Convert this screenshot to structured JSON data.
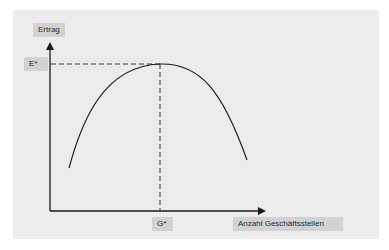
{
  "diagram": {
    "type": "curve-with-optimum",
    "y_axis_label": "Ertrag",
    "x_axis_label": "Anzahl Geschäftsstellen",
    "optimum_y_label": "E*",
    "optimum_x_label": "G*",
    "curve_description": "inverted-U (Ertrag vs. Anzahl Geschäftsstellen), maximum at (G*, E*)",
    "colors": {
      "panel_background": "#ececec",
      "label_background": "#d2d2d2",
      "line": "#1a1a1a"
    }
  }
}
